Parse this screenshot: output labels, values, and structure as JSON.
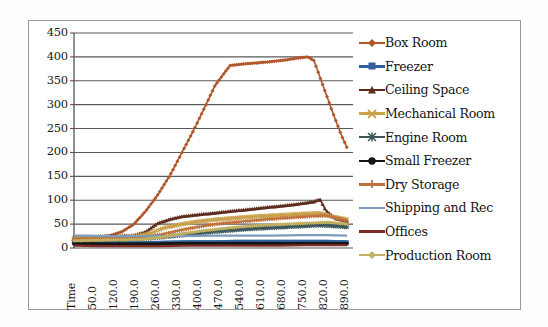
{
  "chart_data": {
    "type": "line",
    "title": "",
    "xlabel": "Time",
    "ylabel": "",
    "ylim": [
      0,
      450
    ],
    "ytick_step": 50,
    "yticks": [
      "0",
      "50",
      "100",
      "150",
      "200",
      "250",
      "300",
      "350",
      "400",
      "450"
    ],
    "grid": true,
    "legend_position": "right",
    "xtick_labels": [
      "Time",
      "50.0",
      "120.0",
      "190.0",
      "260.0",
      "330.0",
      "400.0",
      "470.0",
      "540.0",
      "610.0",
      "680.0",
      "750.0",
      "820.0",
      "890.0"
    ],
    "x": [
      0,
      70,
      140,
      210,
      280,
      350,
      420,
      490,
      560,
      630,
      700,
      770,
      840,
      910
    ],
    "xlim": [
      0,
      930
    ],
    "series": [
      {
        "name": "Box Room",
        "color": "#b1562b",
        "marker": "diamond",
        "x": [
          0,
          40,
          80,
          120,
          160,
          200,
          240,
          280,
          320,
          360,
          400,
          440,
          470,
          520,
          580,
          640,
          700,
          750,
          780,
          800,
          830,
          860,
          890,
          910
        ],
        "values": [
          18,
          20,
          22,
          26,
          34,
          50,
          78,
          112,
          152,
          200,
          248,
          300,
          340,
          382,
          386,
          389,
          393,
          398,
          400,
          392,
          340,
          288,
          238,
          210
        ]
      },
      {
        "name": "Freezer",
        "color": "#31609c",
        "marker": "square",
        "x": [
          0,
          60,
          140,
          220,
          300,
          380,
          460,
          540,
          620,
          700,
          780,
          840,
          910
        ],
        "values": [
          13,
          11,
          10,
          10,
          11,
          12,
          12,
          13,
          13,
          13,
          13,
          13,
          12
        ]
      },
      {
        "name": "Ceiling Space",
        "color": "#5f2d1e",
        "marker": "triangle",
        "x": [
          0,
          60,
          140,
          200,
          240,
          280,
          320,
          360,
          420,
          480,
          540,
          600,
          660,
          720,
          770,
          800,
          820,
          840,
          870,
          910
        ],
        "values": [
          22,
          24,
          25,
          26,
          34,
          52,
          60,
          66,
          70,
          74,
          78,
          82,
          86,
          90,
          94,
          97,
          102,
          78,
          62,
          56
        ]
      },
      {
        "name": "Mechanical Room",
        "color": "#c9a24a",
        "marker": "x",
        "x": [
          0,
          60,
          140,
          200,
          250,
          300,
          360,
          420,
          480,
          540,
          600,
          660,
          720,
          780,
          820,
          860,
          910
        ],
        "values": [
          20,
          22,
          23,
          24,
          30,
          42,
          50,
          56,
          60,
          63,
          66,
          68,
          70,
          72,
          73,
          66,
          60
        ]
      },
      {
        "name": "Engine Room",
        "color": "#3c565c",
        "marker": "asterisk",
        "x": [
          0,
          60,
          140,
          220,
          280,
          340,
          400,
          460,
          520,
          580,
          640,
          700,
          760,
          820,
          870,
          910
        ],
        "values": [
          16,
          17,
          18,
          19,
          22,
          26,
          30,
          34,
          37,
          40,
          42,
          44,
          46,
          48,
          46,
          44
        ]
      },
      {
        "name": "Small Freezer",
        "color": "#161616",
        "marker": "circle",
        "x": [
          0,
          80,
          180,
          280,
          380,
          480,
          580,
          680,
          780,
          860,
          910
        ],
        "values": [
          9,
          8,
          8,
          8,
          9,
          9,
          9,
          9,
          9,
          9,
          9
        ]
      },
      {
        "name": "Dry Storage",
        "color": "#c0703c",
        "marker": "plus",
        "x": [
          0,
          60,
          140,
          220,
          290,
          360,
          430,
          500,
          570,
          640,
          710,
          780,
          840,
          910
        ],
        "values": [
          18,
          20,
          21,
          22,
          28,
          38,
          46,
          52,
          56,
          60,
          63,
          66,
          68,
          58
        ]
      },
      {
        "name": "Shipping and Rec",
        "color": "#7c9cbb",
        "marker": "none",
        "x": [
          0,
          30,
          80,
          160,
          260,
          360,
          460,
          560,
          660,
          760,
          840,
          910
        ],
        "values": [
          26,
          26,
          25,
          25,
          25,
          25,
          26,
          26,
          26,
          27,
          27,
          26
        ]
      },
      {
        "name": "Offices",
        "color": "#7d2b22",
        "marker": "none",
        "x": [
          0,
          80,
          180,
          280,
          380,
          480,
          580,
          680,
          780,
          860,
          910
        ],
        "values": [
          5,
          4,
          4,
          4,
          5,
          5,
          5,
          5,
          6,
          6,
          6
        ]
      },
      {
        "name": "Production Room",
        "color": "#c0b060",
        "marker": "diamond",
        "x": [
          0,
          60,
          140,
          220,
          290,
          360,
          430,
          500,
          570,
          640,
          710,
          780,
          850,
          910
        ],
        "values": [
          15,
          16,
          17,
          18,
          22,
          30,
          36,
          41,
          45,
          48,
          50,
          52,
          54,
          50
        ]
      }
    ]
  },
  "legend": {
    "items": [
      {
        "label": "Box Room"
      },
      {
        "label": "Freezer"
      },
      {
        "label": "Ceiling Space"
      },
      {
        "label": "Mechanical Room"
      },
      {
        "label": "Engine Room"
      },
      {
        "label": "Small Freezer"
      },
      {
        "label": "Dry Storage"
      },
      {
        "label": "Shipping and Rec"
      },
      {
        "label": "Offices"
      },
      {
        "label": "Production Room"
      }
    ]
  },
  "colors": {
    "frame_border": "#9a9a9a",
    "gridline": "#585858",
    "axis": "#555555",
    "text": "#1a1a1a",
    "background": "#ffffff"
  }
}
